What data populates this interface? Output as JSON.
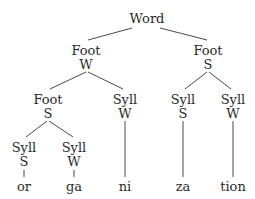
{
  "diagram": {
    "type": "prosodic-tree",
    "nodes": {
      "root": {
        "cat": "Word",
        "x": 147,
        "y": 11
      },
      "foot_w": {
        "cat": "Foot",
        "stress": "W",
        "x": 86,
        "y": 43
      },
      "foot_s_right": {
        "cat": "Foot",
        "stress": "S",
        "x": 208,
        "y": 43
      },
      "foot_s_left": {
        "cat": "Foot",
        "stress": "S",
        "x": 48,
        "y": 92
      },
      "syll_w_ni": {
        "cat": "Syll",
        "stress": "W",
        "x": 125,
        "y": 92
      },
      "syll_s_za": {
        "cat": "Syll",
        "stress": "S",
        "x": 183,
        "y": 92
      },
      "syll_w_tion": {
        "cat": "Syll",
        "stress": "W",
        "x": 233,
        "y": 92
      },
      "syll_s_or": {
        "cat": "Syll",
        "stress": "S",
        "x": 24,
        "y": 140
      },
      "syll_w_ga": {
        "cat": "Syll",
        "stress": "W",
        "x": 74,
        "y": 140
      }
    },
    "leaves": [
      {
        "text": "or",
        "x": 24
      },
      {
        "text": "ga",
        "x": 74
      },
      {
        "text": "ni",
        "x": 125
      },
      {
        "text": "za",
        "x": 183
      },
      {
        "text": "tion",
        "x": 233
      }
    ],
    "leaf_y": 179
  }
}
